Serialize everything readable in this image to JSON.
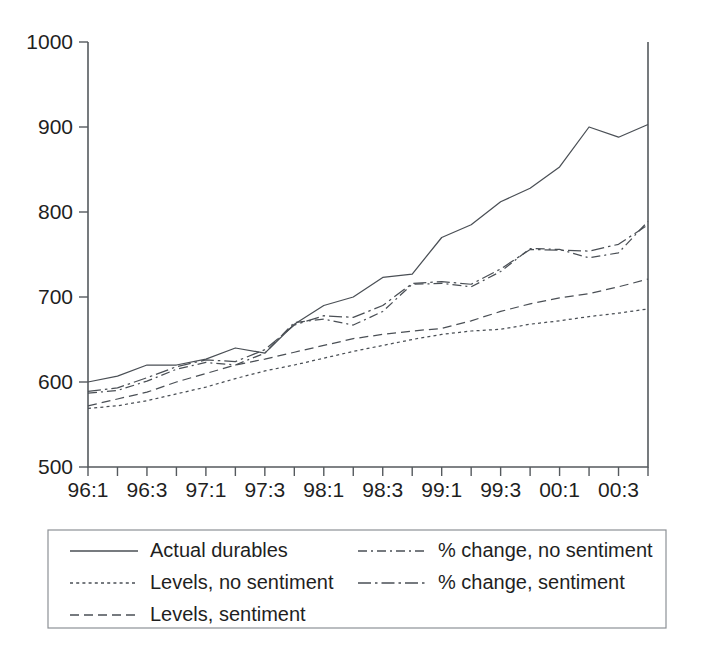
{
  "chart_data": {
    "type": "line",
    "title": "",
    "xlabel": "",
    "ylabel": "",
    "ylim": [
      500,
      1000
    ],
    "yticks": [
      500,
      600,
      700,
      800,
      900,
      1000
    ],
    "ytick_labels": [
      "500",
      "600",
      "700",
      "800",
      "900",
      "1000"
    ],
    "grid": false,
    "legend_position": "bottom",
    "x": [
      "96:1",
      "96:2",
      "96:3",
      "96:4",
      "97:1",
      "97:2",
      "97:3",
      "97:4",
      "98:1",
      "98:2",
      "98:3",
      "98:4",
      "99:1",
      "99:2",
      "99:3",
      "99:4",
      "00:1",
      "00:2",
      "00:3",
      "00:4"
    ],
    "xtick_labels": [
      "96:1",
      "96:3",
      "97:1",
      "97:3",
      "98:1",
      "98:3",
      "99:1",
      "99:3",
      "00:1",
      "00:3"
    ],
    "xtick_indices": [
      0,
      2,
      4,
      6,
      8,
      10,
      12,
      14,
      16,
      18
    ],
    "series": [
      {
        "name": "Actual durables",
        "dash": "none",
        "values": [
          600,
          607,
          620,
          620,
          627,
          640,
          634,
          668,
          690,
          700,
          723,
          727,
          770,
          785,
          812,
          828,
          853,
          900,
          888,
          903
        ]
      },
      {
        "name": "Levels, no sentiment",
        "dash": "dotted",
        "values": [
          569,
          572,
          578,
          586,
          594,
          604,
          613,
          620,
          628,
          636,
          643,
          650,
          656,
          660,
          662,
          668,
          672,
          677,
          681,
          686
        ]
      },
      {
        "name": "Levels, sentiment",
        "dash": "dashed",
        "values": [
          572,
          580,
          588,
          600,
          610,
          620,
          627,
          635,
          643,
          651,
          656,
          660,
          663,
          672,
          683,
          692,
          699,
          704,
          712,
          721
        ]
      },
      {
        "name": "% change, no sentiment",
        "dash": "dashdot",
        "values": [
          587,
          590,
          601,
          615,
          623,
          620,
          634,
          670,
          674,
          667,
          683,
          715,
          716,
          712,
          730,
          757,
          756,
          746,
          752,
          789
        ]
      },
      {
        "name": "% change, sentiment",
        "dash": "longdashdot",
        "values": [
          589,
          593,
          605,
          618,
          626,
          624,
          638,
          667,
          678,
          676,
          690,
          716,
          718,
          715,
          733,
          756,
          755,
          754,
          762,
          785
        ]
      }
    ],
    "series_end_values": [
      903,
      686,
      721,
      776,
      779
    ]
  },
  "legend": {
    "items": [
      {
        "label": "Actual durables",
        "style": "solid"
      },
      {
        "label": "Levels, no sentiment",
        "style": "dotted"
      },
      {
        "label": "Levels, sentiment",
        "style": "dashed"
      },
      {
        "label": "% change, no sentiment",
        "style": "dashdot"
      },
      {
        "label": "% change, sentiment",
        "style": "longdashdot"
      }
    ]
  }
}
